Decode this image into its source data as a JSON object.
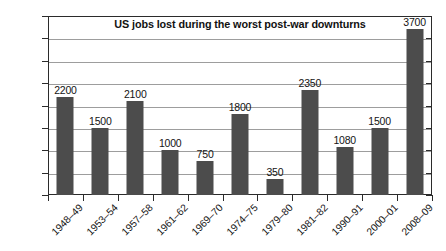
{
  "chart_data": {
    "type": "bar",
    "title": "US jobs lost during the worst post-war downturns",
    "xlabel": "",
    "ylabel": "",
    "categories": [
      "1948–49",
      "1953–54",
      "1957–58",
      "1961–62",
      "1969–70",
      "1974–75",
      "1979–80",
      "1981–82",
      "1990–91",
      "2000–01",
      "2008–09"
    ],
    "values": [
      2200,
      1500,
      2100,
      1000,
      750,
      1800,
      350,
      2350,
      1080,
      1500,
      3700
    ],
    "value_labels": [
      "2200",
      "1500",
      "2100",
      "1000",
      "750",
      "1800",
      "350",
      "2350",
      "1080",
      "1500",
      "3700"
    ],
    "ylim": [
      0,
      4000
    ],
    "ytick_values": [
      0,
      500,
      1000,
      1500,
      2000,
      2500,
      3000,
      3500,
      4000
    ],
    "ytick_labels": [
      "0",
      "500",
      "1000",
      "1500",
      "2000",
      "2500",
      "3000",
      "3500",
      "4000"
    ],
    "grid": true,
    "legend": false,
    "bar_color": "#4c4c4c",
    "gridline_color": "#9d9d9d",
    "axis_color": "#2b2b2b",
    "background_color": "#ffffff"
  }
}
